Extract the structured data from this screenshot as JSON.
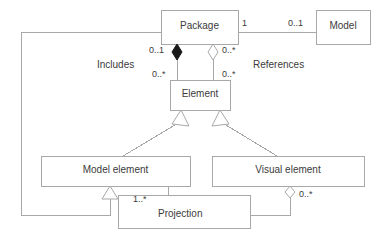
{
  "diagram": {
    "type": "uml-class-diagram",
    "width": 384,
    "height": 233,
    "colors": {
      "background": "#ffffff",
      "stroke": "#a8a8a8",
      "text": "#3b3b3b",
      "fill_solid": "#1a1a1a",
      "fill_hollow": "#ffffff"
    },
    "classes": [
      {
        "id": "package",
        "name": "Package",
        "x": 161,
        "y": 10,
        "w": 77,
        "h": 34
      },
      {
        "id": "model",
        "name": "Model",
        "x": 316,
        "y": 10,
        "w": 54,
        "h": 34
      },
      {
        "id": "element",
        "name": "Element",
        "x": 170,
        "y": 80,
        "w": 60,
        "h": 30
      },
      {
        "id": "model_element",
        "name": "Model element",
        "x": 41,
        "y": 156,
        "w": 149,
        "h": 30
      },
      {
        "id": "visual_element",
        "name": "Visual element",
        "x": 212,
        "y": 156,
        "w": 152,
        "h": 30
      },
      {
        "id": "projection",
        "name": "Projection",
        "x": 118,
        "y": 195,
        "w": 132,
        "h": 33
      }
    ],
    "association_labels": [
      {
        "id": "includes",
        "text": "Includes",
        "x": 97,
        "y": 59
      },
      {
        "id": "references",
        "text": "References",
        "x": 253,
        "y": 59
      }
    ],
    "multiplicities": [
      {
        "id": "package-to-model-one",
        "text": "1",
        "x": 242,
        "y": 18
      },
      {
        "id": "model-to-package",
        "text": "0..1",
        "x": 288,
        "y": 18
      },
      {
        "id": "includes-package-end",
        "text": "0..1",
        "x": 155,
        "y": 46
      },
      {
        "id": "references-package-end",
        "text": "0..*",
        "x": 227,
        "y": 46
      },
      {
        "id": "includes-element-end",
        "text": "0..*",
        "x": 155,
        "y": 68
      },
      {
        "id": "references-element-end",
        "text": "0..*",
        "x": 227,
        "y": 68
      },
      {
        "id": "projection-model-end",
        "text": "1..*",
        "x": 133,
        "y": 193
      },
      {
        "id": "projection-visual-end",
        "text": "0..*",
        "x": 297,
        "y": 190
      }
    ],
    "relationships": [
      {
        "id": "package-model-association",
        "kind": "association",
        "from": "package",
        "to": "model"
      },
      {
        "id": "package-includes-element",
        "kind": "composition",
        "from": "package",
        "to": "element",
        "label": "Includes"
      },
      {
        "id": "package-references-element",
        "kind": "aggregation",
        "from": "package",
        "to": "element",
        "label": "References"
      },
      {
        "id": "model-element-inherits-element",
        "kind": "generalization",
        "from": "model_element",
        "to": "element"
      },
      {
        "id": "visual-element-inherits-element",
        "kind": "generalization",
        "from": "visual_element",
        "to": "element"
      },
      {
        "id": "package-inherits-model-element",
        "kind": "generalization",
        "from": "package",
        "to": "model_element"
      },
      {
        "id": "projection-model-element",
        "kind": "association",
        "from": "projection",
        "to": "model_element"
      },
      {
        "id": "projection-visual-element",
        "kind": "aggregation",
        "from": "visual_element",
        "to": "projection",
        "label": "Projection"
      }
    ]
  }
}
